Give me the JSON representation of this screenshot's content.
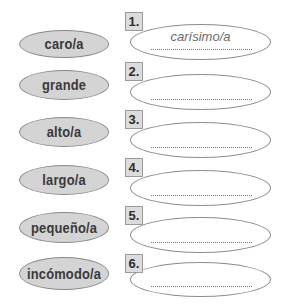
{
  "exercise": {
    "rows": [
      {
        "number": "1.",
        "word": "caro/a",
        "answer": "carísimo/a"
      },
      {
        "number": "2.",
        "word": "grande",
        "answer": ""
      },
      {
        "number": "3.",
        "word": "alto/a",
        "answer": ""
      },
      {
        "number": "4.",
        "word": "largo/a",
        "answer": ""
      },
      {
        "number": "5.",
        "word": "pequeño/a",
        "answer": ""
      },
      {
        "number": "6.",
        "word": "incómodo/a",
        "answer": ""
      }
    ]
  },
  "colors": {
    "word_fill": "#d4d4d4",
    "number_box_fill": "#dcdcdc",
    "outline": "#8c8c8c"
  }
}
